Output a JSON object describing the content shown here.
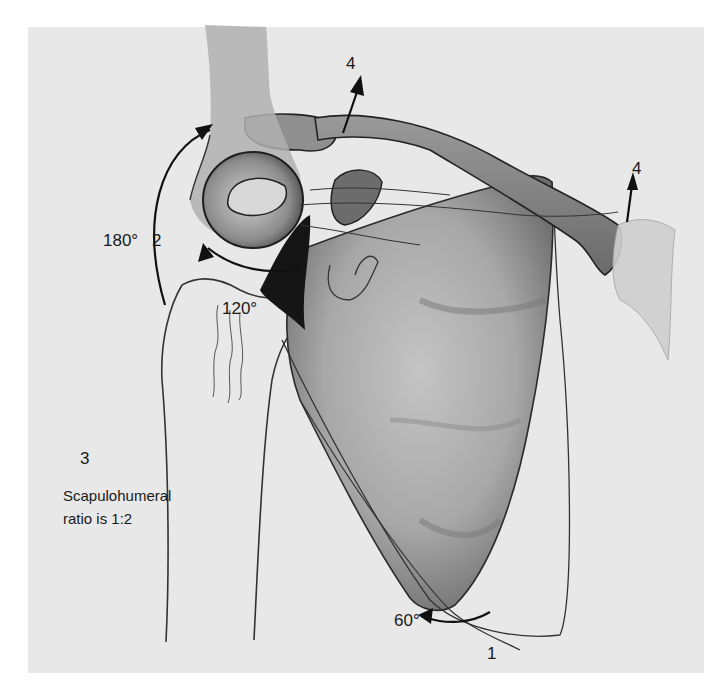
{
  "figure": {
    "colors": {
      "background": "#ffffff",
      "panel": "#e8e8e8",
      "ink": "#1a1a1a",
      "bone_shade": "#8a8a8a"
    }
  },
  "labels": {
    "arm_angle": "180°",
    "arm_step": "2",
    "humerus_angle": "120°",
    "scapula_angle": "60°",
    "scapula_step": "1",
    "clavicle_step_left": "4",
    "clavicle_step_right": "4",
    "ratio_step": "3",
    "ratio_line1": "Scapulohumeral",
    "ratio_line2": "ratio is 1:2"
  }
}
